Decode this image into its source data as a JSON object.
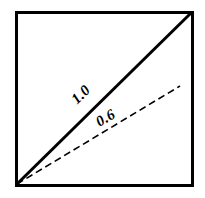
{
  "figure": {
    "kind": "geometric-line-diagram",
    "background_color": "#ffffff",
    "stroke_color": "#000000"
  },
  "frame": {
    "label": "square-border",
    "x": 16,
    "y": 12,
    "width": 176,
    "height": 173,
    "stroke_width": 3
  },
  "lines": [
    {
      "name": "solid-diagonal",
      "label": "1.0",
      "style": "solid",
      "stroke_width": 3,
      "x1": 17,
      "y1": 184,
      "x2": 191,
      "y2": 13
    },
    {
      "name": "dashed-line",
      "label": "0.6",
      "style": "dashed",
      "stroke_width": 1.6,
      "dash_pattern": "7 4",
      "x1": 17,
      "y1": 184,
      "x2": 180,
      "y2": 86
    }
  ],
  "labels": [
    {
      "name": "slope-label-solid",
      "text": "1.0",
      "x": 84,
      "y": 98,
      "rotation": -44,
      "font_size": 15
    },
    {
      "name": "slope-label-dashed",
      "text": "0.6",
      "x": 108,
      "y": 122,
      "rotation": -31,
      "font_size": 15
    }
  ]
}
